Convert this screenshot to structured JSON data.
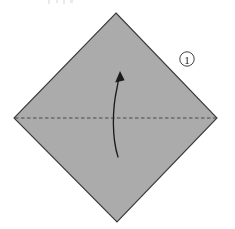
{
  "figure": {
    "name": "origami-fold-step-1",
    "caption": "",
    "background_color": "#ffffff",
    "width": 235,
    "height": 229
  },
  "step_marker": {
    "label": "1",
    "glyph": "①",
    "circled": true,
    "text_color": "#1a1a1a",
    "circle_color": "#2b2b2b",
    "position": {
      "x": 187,
      "y": 59
    }
  },
  "paper": {
    "name": "square-sheet-rotated-45",
    "shape": "diamond",
    "fill_color": "#ababab",
    "stroke_color": "#3a3a3a",
    "stroke_width": 1.1,
    "vertices": [
      {
        "name": "top",
        "x": 116,
        "y": 13
      },
      {
        "name": "right",
        "x": 217,
        "y": 118
      },
      {
        "name": "bottom",
        "x": 117,
        "y": 222
      },
      {
        "name": "left",
        "x": 14,
        "y": 118
      }
    ]
  },
  "fold_line": {
    "name": "horizontal-valley-fold",
    "style": "dashed",
    "color": "#4a4a4a",
    "stroke_width": 1.2,
    "dash_pattern": "3.5 2.5",
    "from": {
      "x": 15,
      "y": 118
    },
    "to": {
      "x": 216,
      "y": 118
    }
  },
  "fold_arrow": {
    "name": "upward-fold-arrow",
    "color": "#1a1a1a",
    "stroke_width": 1.3,
    "direction": "upward",
    "curve": "M 118 157 C 112 138, 112 110, 117 88 C 118 82, 119 78, 120 75",
    "head": {
      "points": "120 71 115.2 82.4 124.6 80.2",
      "x": 120,
      "y": 73
    },
    "tail": {
      "x": 118,
      "y": 157
    }
  },
  "top_edge_artifacts": {
    "name": "cropped-text-remnant",
    "color": "#808080",
    "marks": [
      {
        "x": 48,
        "y": 0,
        "width": 2,
        "height": 4
      },
      {
        "x": 56,
        "y": 0,
        "width": 2,
        "height": 3
      },
      {
        "x": 63,
        "y": 0,
        "width": 2,
        "height": 4
      },
      {
        "x": 70,
        "y": 0,
        "width": 3,
        "height": 3
      }
    ]
  }
}
